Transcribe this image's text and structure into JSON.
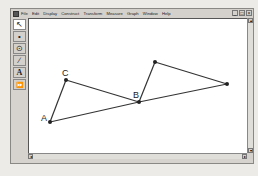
{
  "menubar": {
    "items": [
      "File",
      "Edit",
      "Display",
      "Construct",
      "Transform",
      "Measure",
      "Graph",
      "Window",
      "Help"
    ],
    "window_controls": [
      "_",
      "□",
      "×"
    ]
  },
  "toolbox": {
    "tools": [
      {
        "name": "arrow-tool",
        "glyph": "↖"
      },
      {
        "name": "point-tool",
        "glyph": "•"
      },
      {
        "name": "compass-tool",
        "glyph": "⊙"
      },
      {
        "name": "straightedge-tool",
        "glyph": "∕"
      },
      {
        "name": "text-tool",
        "glyph": "A"
      },
      {
        "name": "custom-tool",
        "glyph": "⏩"
      }
    ]
  },
  "scrollbars": {
    "up": "▴",
    "down": "▾",
    "left": "◂",
    "right": "▸"
  },
  "drawing": {
    "points": [
      {
        "label": "A",
        "x": 50,
        "y": 122
      },
      {
        "label": "C",
        "x": 66,
        "y": 80
      },
      {
        "label": "B",
        "x": 139,
        "y": 102
      },
      {
        "label": "",
        "x": 155,
        "y": 62
      },
      {
        "label": "",
        "x": 227,
        "y": 84
      }
    ],
    "segments": [
      [
        0,
        1
      ],
      [
        1,
        2
      ],
      [
        0,
        2
      ],
      [
        2,
        3
      ],
      [
        3,
        4
      ],
      [
        2,
        4
      ]
    ],
    "line_color": "#333333",
    "point_color": "#222222"
  }
}
